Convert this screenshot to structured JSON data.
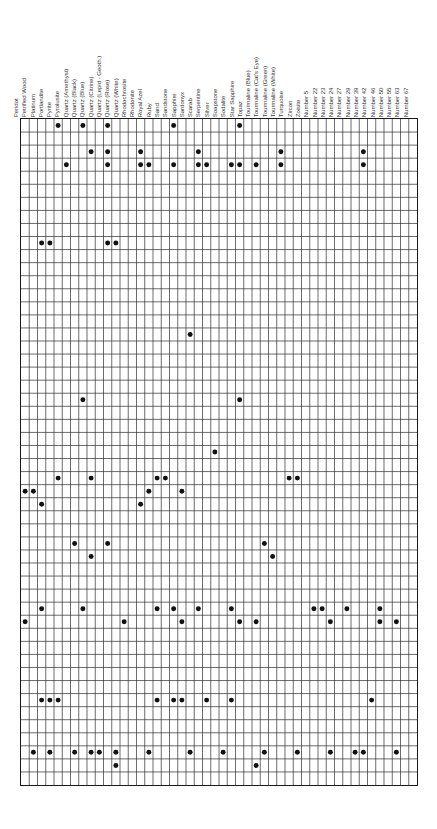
{
  "figure": {
    "name": "material-presence-matrix",
    "type": "presence-matrix",
    "grid": {
      "columns": 47,
      "rows": 51,
      "dot_marker": "filled-circle",
      "line_color": "#2b2b2b",
      "dot_color": "#111111",
      "background": "#ffffff"
    }
  },
  "chart_data": {
    "type": "heatmap",
    "title": "",
    "xlabel": "",
    "ylabel": "",
    "grid": true,
    "legend": "none",
    "categories": [
      "Peridot",
      "Petrified Wood",
      "Platinum",
      "Portlandite",
      "Pyrite",
      "Pyrolusite",
      "Quartz (Amethyst)",
      "Quartz (Black)",
      "Quartz (Blue)",
      "Quartz (Citrine)",
      "Quartz (Lepid - Geoth.)",
      "Quartz (Rose)",
      "Quartz (White)",
      "Rhodochrosite",
      "Rhodonite",
      "Royal Azel",
      "Ruby",
      "Sand",
      "Sandstone",
      "Sapphire",
      "Sardonyx",
      "Scarab",
      "Serpentine",
      "Silver",
      "Soapstone",
      "Sodalite",
      "Star Sapphire",
      "Topaz",
      "Tourmaline (Blue)",
      "Tourmaline (Cat's Eye)",
      "Tourmaline (Green)",
      "Tourmaline (White)",
      "Turquoise",
      "Zircon",
      "Zoisite",
      "Number 5",
      "Number 22",
      "Number 23",
      "Number 24",
      "Number 27",
      "Number 29",
      "Number 39",
      "Number 42",
      "Number 46",
      "Number 50",
      "Number 55",
      "Number 63",
      "Number 67"
    ],
    "rows": [
      {
        "index": 1,
        "cells": [
          5,
          8,
          11,
          19,
          27
        ]
      },
      {
        "index": 2,
        "cells": []
      },
      {
        "index": 3,
        "cells": [
          9,
          11,
          15,
          22,
          32,
          42
        ]
      },
      {
        "index": 4,
        "cells": [
          6,
          11,
          15,
          16,
          19,
          22,
          23,
          26,
          27,
          29,
          32,
          42
        ]
      },
      {
        "index": 5,
        "cells": []
      },
      {
        "index": 6,
        "cells": []
      },
      {
        "index": 7,
        "cells": []
      },
      {
        "index": 8,
        "cells": []
      },
      {
        "index": 9,
        "cells": []
      },
      {
        "index": 10,
        "cells": [
          3,
          4,
          11,
          12
        ]
      },
      {
        "index": 11,
        "cells": []
      },
      {
        "index": 12,
        "cells": []
      },
      {
        "index": 13,
        "cells": []
      },
      {
        "index": 14,
        "cells": []
      },
      {
        "index": 15,
        "cells": []
      },
      {
        "index": 16,
        "cells": []
      },
      {
        "index": 17,
        "cells": [
          21
        ]
      },
      {
        "index": 18,
        "cells": []
      },
      {
        "index": 19,
        "cells": []
      },
      {
        "index": 20,
        "cells": []
      },
      {
        "index": 21,
        "cells": []
      },
      {
        "index": 22,
        "cells": [
          8,
          27
        ]
      },
      {
        "index": 23,
        "cells": []
      },
      {
        "index": 24,
        "cells": []
      },
      {
        "index": 25,
        "cells": []
      },
      {
        "index": 26,
        "cells": [
          24
        ]
      },
      {
        "index": 27,
        "cells": []
      },
      {
        "index": 28,
        "cells": [
          5,
          9,
          17,
          18,
          33,
          34
        ]
      },
      {
        "index": 29,
        "cells": [
          1,
          2,
          16,
          20
        ]
      },
      {
        "index": 30,
        "cells": [
          3,
          15
        ]
      },
      {
        "index": 31,
        "cells": []
      },
      {
        "index": 32,
        "cells": []
      },
      {
        "index": 33,
        "cells": [
          7,
          11,
          30
        ]
      },
      {
        "index": 34,
        "cells": [
          9,
          31
        ]
      },
      {
        "index": 35,
        "cells": []
      },
      {
        "index": 36,
        "cells": []
      },
      {
        "index": 37,
        "cells": []
      },
      {
        "index": 38,
        "cells": [
          3,
          8,
          17,
          19,
          22,
          26,
          36,
          37,
          40,
          44
        ]
      },
      {
        "index": 39,
        "cells": [
          1,
          13,
          20,
          27,
          29,
          38,
          44,
          46
        ]
      },
      {
        "index": 40,
        "cells": []
      },
      {
        "index": 41,
        "cells": []
      },
      {
        "index": 42,
        "cells": []
      },
      {
        "index": 43,
        "cells": []
      },
      {
        "index": 44,
        "cells": []
      },
      {
        "index": 45,
        "cells": [
          3,
          4,
          5,
          17,
          19,
          20,
          23,
          26,
          43
        ]
      },
      {
        "index": 46,
        "cells": []
      },
      {
        "index": 47,
        "cells": []
      },
      {
        "index": 48,
        "cells": []
      },
      {
        "index": 49,
        "cells": [
          2,
          4,
          7,
          9,
          10,
          12,
          16,
          21,
          25,
          30,
          34,
          38,
          41,
          42,
          46
        ]
      },
      {
        "index": 50,
        "cells": [
          12,
          29
        ]
      },
      {
        "index": 51,
        "cells": []
      }
    ]
  }
}
